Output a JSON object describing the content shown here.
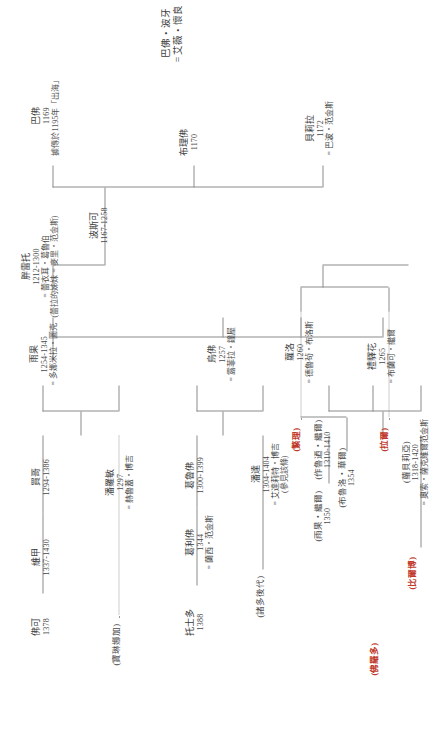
{
  "document": {
    "kind": "family-tree",
    "title_lines": [
      "巴佛・波牙",
      "= 艾薇・懷良"
    ]
  },
  "nodes": {
    "bifur": {
      "name": "巴佛",
      "years": "1169",
      "note": "據傳於1195年「出海」"
    },
    "bofur": {
      "name": "布理佛",
      "years": "1170"
    },
    "bombur": {
      "name": "貝莉拉",
      "years": "1172",
      "spouse": "= 巴波・范金斯"
    },
    "bosco": {
      "name": "波斯可",
      "years": "1167-1258"
    },
    "ponto": {
      "name": "胖雷托",
      "years": "1212-1300",
      "spouse": "= 蕾衣耳・葛魯伯",
      "note": "(蕾拉的姊妹 = 麥里・范金斯)"
    },
    "hugo": {
      "name": "雨果",
      "years": "1254-1345",
      "spouse": "= 多娜米拉・圖克"
    },
    "mungo": {
      "name": "買哥",
      "years": "1294-1386"
    },
    "pansy": {
      "name": "潘羅敏",
      "years": "1297",
      "spouse": "= 赫魯蓋・博吉"
    },
    "vigo": {
      "name": "維甲",
      "years": "1337-1430"
    },
    "folco": {
      "name": "佛可",
      "years": "1378"
    },
    "paulina": {
      "name": "(寶琳娜加)"
    },
    "ufo": {
      "name": "烏佛",
      "years": "1257",
      "spouse": "= 露菲拉・鐘屋"
    },
    "grover": {
      "name": "葛魯佛",
      "years": "1300-1399"
    },
    "ponda": {
      "name": "潘達",
      "years": "1304-1404",
      "spouse": "= 艾達莉特・博吉",
      "note": "(參見該條)"
    },
    "griffo": {
      "name": "葛利佛",
      "years": "1344",
      "spouse": "= 蘭西・范金斯"
    },
    "togo": {
      "name": "托士多",
      "years": "1388"
    },
    "many": {
      "name": "(諸多後代)"
    },
    "luoluo": {
      "name": "蘿洛",
      "years": "1260",
      "spouse": "= 德魯茍・布洛斯"
    },
    "borolo": {
      "name": "禮驛花",
      "years": "1265",
      "spouse": "= 布蘭可・繼爾"
    },
    "bruluo": {
      "name": "(布魯洛・華爾)",
      "years": "1354"
    },
    "buluoda": {
      "name": "(作魯迺・繼爾)",
      "years": "1310-1410"
    },
    "yuguo": {
      "name": "(雨果・繼爾)",
      "years": "1350"
    },
    "luobeiji": {
      "name": "(蘿貝莉亞)",
      "years": "1318-1420",
      "spouse": "= 奧索・薩克維爾范金斯"
    },
    "bilbo": {
      "name": "(比爾博)"
    },
    "lotho": {
      "name": "(佛羅多)"
    },
    "merry": {
      "name": "(繁理)"
    },
    "lanuo": {
      "name": "(拉爾)"
    }
  },
  "icons": {
    "marriage": "=",
    "lineage": "line-connector"
  },
  "colors": {
    "ink": "#4a4a4a",
    "line": "#8c8c8c",
    "highlight": "#c0392b"
  }
}
